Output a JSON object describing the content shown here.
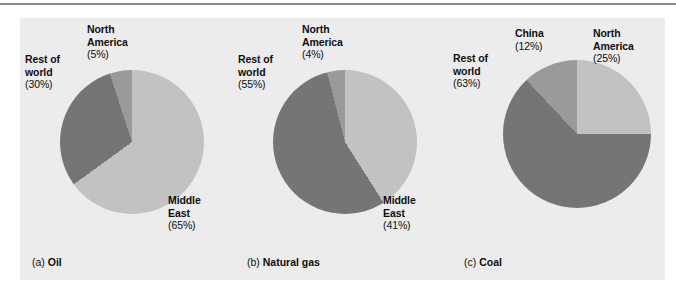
{
  "figure": {
    "background": "#ececec",
    "rule_color": "#8a8a8e"
  },
  "palette": {
    "light": "#c2c2c2",
    "medium": "#9a9a9a",
    "dark": "#757575"
  },
  "charts": [
    {
      "caption_ordinal": "(a)",
      "caption_title": "Oil",
      "caption_full": "(a) Oil",
      "labels": {
        "north_america_name": "North\nAmerica",
        "north_america_line1": "North",
        "north_america_line2": "America",
        "north_america_pct": "(5%)",
        "rest_line1": "Rest of",
        "rest_line2": "world",
        "rest_pct": "(30%)",
        "middle_east_line1": "Middle",
        "middle_east_line2": "East",
        "middle_east_pct": "(65%)"
      }
    },
    {
      "caption_ordinal": "(b)",
      "caption_title": "Natural gas",
      "caption_full": "(b) Natural gas",
      "labels": {
        "north_america_line1": "North",
        "north_america_line2": "America",
        "north_america_pct": "(4%)",
        "rest_line1": "Rest of",
        "rest_line2": "world",
        "rest_pct": "(55%)",
        "middle_east_line1": "Middle",
        "middle_east_line2": "East",
        "middle_east_pct": "(41%)"
      }
    },
    {
      "caption_ordinal": "(c)",
      "caption_title": "Coal",
      "caption_full": "(c) Coal",
      "labels": {
        "china_line1": "China",
        "china_pct": "(12%)",
        "north_america_line1": "North",
        "north_america_line2": "America",
        "north_america_pct": "(25%)",
        "rest_line1": "Rest of",
        "rest_line2": "world",
        "rest_pct": "(63%)"
      }
    }
  ],
  "chart_data": [
    {
      "type": "pie",
      "title": "(a) Oil",
      "categories": [
        "Middle East",
        "Rest of world",
        "North America"
      ],
      "values": [
        65,
        30,
        5
      ],
      "labels": [
        "Middle East (65%)",
        "Rest of world (30%)",
        "North America (5%)"
      ],
      "colors": [
        "#c2c2c2",
        "#757575",
        "#9a9a9a"
      ],
      "units": "percent",
      "start_angle_deg": 0,
      "direction": "clockwise",
      "legend": "none",
      "grid": false
    },
    {
      "type": "pie",
      "title": "(b) Natural gas",
      "categories": [
        "Middle East",
        "Rest of world",
        "North America"
      ],
      "values": [
        41,
        55,
        4
      ],
      "labels": [
        "Middle East (41%)",
        "Rest of world (55%)",
        "North America (4%)"
      ],
      "colors": [
        "#c2c2c2",
        "#757575",
        "#9a9a9a"
      ],
      "units": "percent",
      "start_angle_deg": 0,
      "direction": "clockwise",
      "legend": "none",
      "grid": false
    },
    {
      "type": "pie",
      "title": "(c) Coal",
      "categories": [
        "North America",
        "Rest of world",
        "China"
      ],
      "values": [
        25,
        63,
        12
      ],
      "labels": [
        "North America (25%)",
        "Rest of world (63%)",
        "China (12%)"
      ],
      "colors": [
        "#c2c2c2",
        "#757575",
        "#9a9a9a"
      ],
      "units": "percent",
      "start_angle_deg": 0,
      "direction": "clockwise",
      "legend": "none",
      "grid": false
    }
  ]
}
